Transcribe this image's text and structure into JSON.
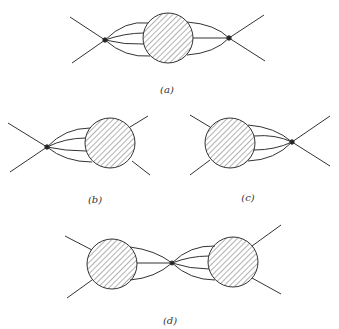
{
  "diagram": {
    "type": "feynman-style scattering diagrams with blob insertions",
    "panels": [
      {
        "id": "a",
        "label": "(a)",
        "description": "two vertices joined through a central hatched blob with multi-line propagators"
      },
      {
        "id": "b",
        "label": "(b)",
        "description": "vertex on left connected by four lines to hatched blob on right"
      },
      {
        "id": "c",
        "label": "(c)",
        "description": "hatched blob on left connected by four lines to vertex on right"
      },
      {
        "id": "d",
        "label": "(d)",
        "description": "two hatched blobs joined by lines through central vertex"
      }
    ],
    "colors": {
      "stroke": "#333333",
      "hatch": "#555555",
      "background": "#ffffff"
    }
  }
}
